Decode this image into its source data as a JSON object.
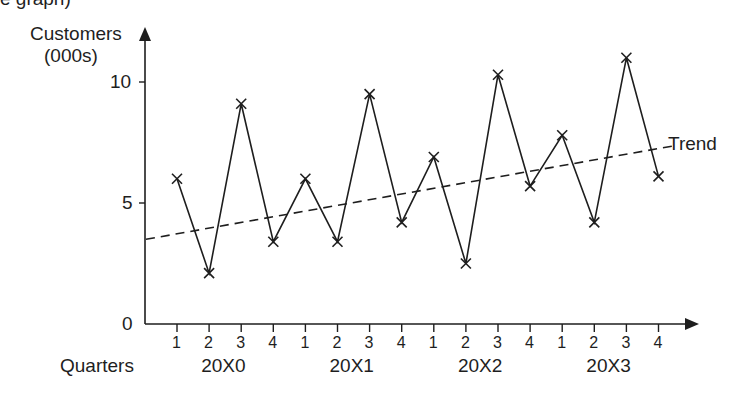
{
  "clipped_caption": "e graph)",
  "chart_data": {
    "type": "line",
    "title": "",
    "ylabel": "Customers (000s)",
    "ylabel_lines": [
      "Customers",
      "(000s)"
    ],
    "xlabel": "Quarters",
    "ylim": [
      0,
      11.5
    ],
    "yticks": [
      0,
      5,
      10
    ],
    "grid": false,
    "categories": [
      "1",
      "2",
      "3",
      "4",
      "1",
      "2",
      "3",
      "4",
      "1",
      "2",
      "3",
      "4",
      "1",
      "2",
      "3",
      "4"
    ],
    "groups": [
      {
        "label": "20X0",
        "quarters": [
          1,
          2,
          3,
          4
        ]
      },
      {
        "label": "20X1",
        "quarters": [
          1,
          2,
          3,
          4
        ]
      },
      {
        "label": "20X2",
        "quarters": [
          1,
          2,
          3,
          4
        ]
      },
      {
        "label": "20X3",
        "quarters": [
          1,
          2,
          3,
          4
        ]
      }
    ],
    "series": [
      {
        "name": "Customers",
        "marker": "x",
        "style": "solid",
        "values": [
          6.0,
          2.1,
          9.1,
          3.4,
          6.0,
          3.4,
          9.5,
          4.2,
          6.9,
          2.5,
          10.3,
          5.7,
          7.8,
          4.2,
          11.0,
          6.1
        ]
      },
      {
        "name": "Trend",
        "style": "dashed",
        "start": 3.5,
        "end": 7.35
      }
    ],
    "annotations": [
      {
        "text": "Trend",
        "position": "end of trend line"
      }
    ],
    "legend": "none (inline label)"
  },
  "colors": {
    "ink": "#1e1e1e",
    "background": "#ffffff"
  }
}
